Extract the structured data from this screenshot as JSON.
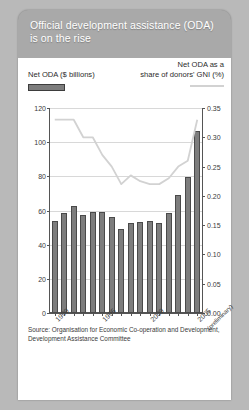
{
  "header": {
    "title": "Official development assistance (ODA) is on the rise"
  },
  "legend": {
    "bars_label": "Net ODA ($ billions)",
    "line_label": "Net ODA as a\nshare of donors' GNI (%)",
    "line_label_1": "Net ODA as a",
    "line_label_2": "share of donors' GNI (%)",
    "bar_swatch_color": "#7d7d7d",
    "line_swatch_color": "#d2d2d2"
  },
  "source": {
    "text": "Source: Organisation for Economic Co-operation and Development, Development Assistance Committee"
  },
  "colors": {
    "panel_background": "#ffffff",
    "card_background": "#a9a9a9",
    "page_background": "#b9b9b9",
    "bar_fill": "#7d7d7d",
    "bar_stroke": "#4a4a4a",
    "line_stroke": "#d2d2d2",
    "gridline": "#d8d8d8",
    "axis": "#555555",
    "title_text": "#ffffff"
  },
  "chart_data": {
    "type": "bar",
    "title": "Official development assistance (ODA) is on the rise",
    "xlabel": "",
    "ylabel": "Net ODA ($ billions)",
    "y2label": "Net ODA as a share of donors' GNI (%)",
    "grid": true,
    "legend_position": "top",
    "categories": [
      "1990",
      "1991",
      "1992",
      "1993",
      "1994",
      "1995",
      "1996",
      "1997",
      "1998",
      "1999",
      "2000",
      "2001",
      "2002",
      "2003",
      "2004",
      "2005"
    ],
    "x_tick_labels": [
      "1990",
      "1995",
      "2000",
      "2005"
    ],
    "x_tick_sublabel": "(preliminary)",
    "ylim": [
      0,
      120
    ],
    "yticks": [
      0,
      20,
      40,
      60,
      80,
      100,
      120
    ],
    "y2lim": [
      0,
      0.35
    ],
    "y2ticks": [
      "0.00",
      "0.05",
      "0.10",
      "0.15",
      "0.20",
      "0.25",
      "0.30",
      "0.35"
    ],
    "y2ticks_values": [
      0,
      0.05,
      0.1,
      0.15,
      0.2,
      0.25,
      0.3,
      0.35
    ],
    "series": [
      {
        "name": "Net ODA ($ billions)",
        "type": "bar",
        "axis": "left",
        "values": [
          54.0,
          58.5,
          62.5,
          57.5,
          59.0,
          59.0,
          56.0,
          49.0,
          52.5,
          53.5,
          53.8,
          52.5,
          58.3,
          69.0,
          79.5,
          106.5
        ]
      },
      {
        "name": "Net ODA as a share of donors' GNI (%)",
        "type": "line",
        "axis": "right",
        "values": [
          0.33,
          0.33,
          0.33,
          0.3,
          0.3,
          0.27,
          0.25,
          0.22,
          0.235,
          0.225,
          0.22,
          0.22,
          0.23,
          0.25,
          0.26,
          0.33
        ]
      }
    ]
  }
}
